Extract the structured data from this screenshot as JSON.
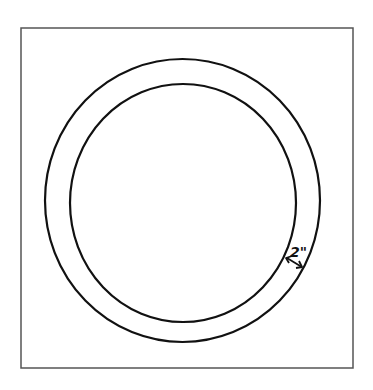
{
  "diagram": {
    "type": "ring-in-square",
    "frame": {
      "x": 21,
      "y": 28,
      "width": 332,
      "height": 340,
      "stroke": "#555555"
    },
    "outer_circle": {
      "cx": 182.5,
      "cy": 200.5,
      "rx": 137.5,
      "ry": 141.5,
      "stroke": "#111111"
    },
    "inner_circle": {
      "cx": 183,
      "cy": 203,
      "rx": 113,
      "ry": 119,
      "stroke": "#111111"
    },
    "dimension": {
      "label": "2\"",
      "arrow": {
        "x1": 286,
        "y1": 258,
        "x2": 302,
        "y2": 267
      }
    }
  }
}
